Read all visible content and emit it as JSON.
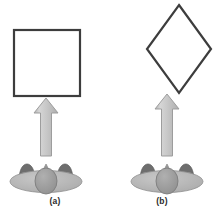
{
  "figure": {
    "background_color": "#ffffff",
    "width": 221,
    "height": 218,
    "panels": [
      {
        "id": "a",
        "caption": "(a)",
        "stimulus": {
          "name": "square",
          "shape": "square",
          "orientation_degrees": 0,
          "stroke_color": "#3d3d3d",
          "stroke_width": 2,
          "fill": "none"
        },
        "arrow": {
          "name": "viewing-direction-arrow",
          "direction": "up",
          "fill_color": "#c9c9c9",
          "stroke_color": "#a0a0a0"
        },
        "observer": {
          "name": "observer-top-view",
          "body_color": "#b6b6b6",
          "head_color": "#9a9a9a",
          "arm_color": "#6e6e6e",
          "outline_color": "#808080"
        }
      },
      {
        "id": "b",
        "caption": "(b)",
        "stimulus": {
          "name": "diamond",
          "shape": "square",
          "orientation_degrees": 45,
          "stroke_color": "#3d3d3d",
          "stroke_width": 2,
          "fill": "none"
        },
        "arrow": {
          "name": "viewing-direction-arrow",
          "direction": "up",
          "fill_color": "#c9c9c9",
          "stroke_color": "#a0a0a0"
        },
        "observer": {
          "name": "observer-top-view",
          "body_color": "#b6b6b6",
          "head_color": "#9a9a9a",
          "arm_color": "#6e6e6e",
          "outline_color": "#808080"
        }
      }
    ]
  },
  "colors": {
    "shape_stroke": "#3d3d3d",
    "arrow_fill": "#c9c9c9",
    "arrow_stroke": "#a0a0a0",
    "observer_body": "#b6b6b6",
    "observer_head": "#9a9a9a",
    "observer_arm": "#6e6e6e",
    "caption_text": "#2b2b2b"
  }
}
